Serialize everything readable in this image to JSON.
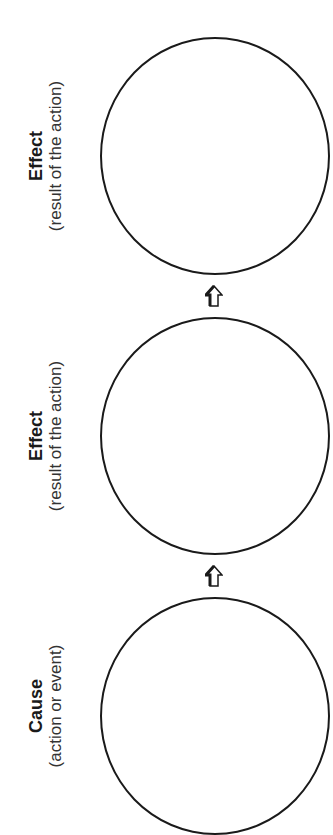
{
  "diagram": {
    "type": "cause-effect chain",
    "orientation": "rotated 90deg counter-clockwise; flow bottom to top",
    "nodes": [
      {
        "title": "Effect",
        "subtitle": "(result of the action)"
      },
      {
        "title": "Effect",
        "subtitle": "(result of the action)"
      },
      {
        "title": "Cause",
        "subtitle": "(action or event)"
      }
    ],
    "arrows": [
      {
        "from": "Cause",
        "to": "Effect",
        "icon": "up-arrow-icon"
      },
      {
        "from": "Effect",
        "to": "Effect",
        "icon": "up-arrow-icon"
      }
    ],
    "colors": {
      "stroke": "#1a1a1a",
      "background": "#ffffff"
    }
  }
}
